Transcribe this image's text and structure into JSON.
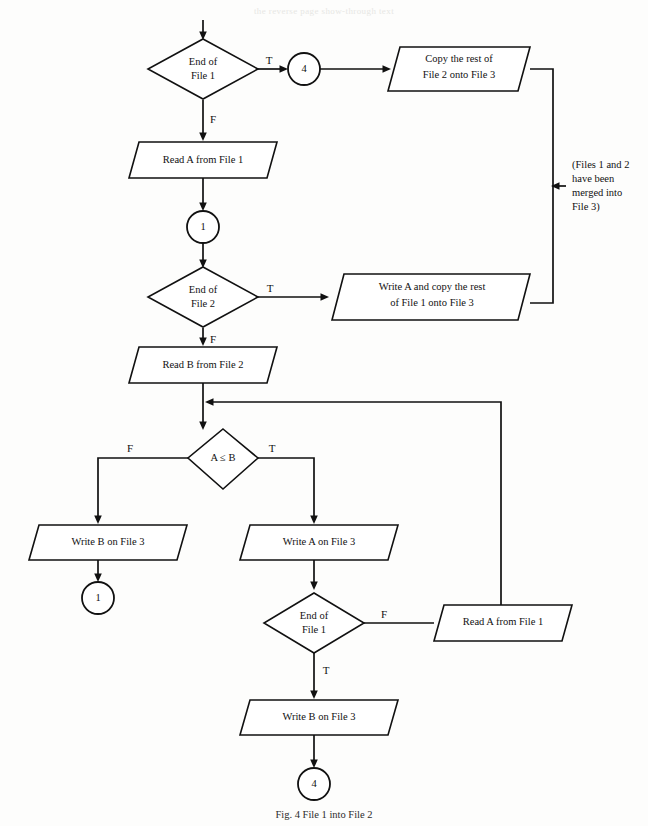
{
  "figure": {
    "caption": "Fig. 4  File 1 into File 2",
    "bleed_top": "the reverse page show-through text"
  },
  "nodes": {
    "d_end_file1_top": {
      "line1": "End of",
      "line2": "File 1"
    },
    "conn_4_top": {
      "label": "4"
    },
    "io_copy_rest_file2": {
      "line1": "Copy the rest of",
      "line2": "File 2 onto File 3"
    },
    "io_read_a_file1_top": {
      "line1": "Read A from File 1"
    },
    "conn_1_mid": {
      "label": "1"
    },
    "d_end_file2": {
      "line1": "End of",
      "line2": "File 2"
    },
    "io_write_a_copy_rest": {
      "line1": "Write A and copy the rest",
      "line2": "of File 1 onto File 3"
    },
    "io_read_b_file2": {
      "line1": "Read B from File 2"
    },
    "d_a_le_b": {
      "line1": "A ≤ B"
    },
    "io_write_b_file3_left": {
      "line1": "Write B on File 3"
    },
    "conn_1_bottom_left": {
      "label": "1"
    },
    "io_write_a_file3": {
      "line1": "Write A on File 3"
    },
    "d_end_file1_bottom": {
      "line1": "End of",
      "line2": "File 1"
    },
    "io_read_a_file1_bottom": {
      "line1": "Read A from File 1"
    },
    "io_write_b_file3_bottom": {
      "line1": "Write B on File 3"
    },
    "conn_4_bottom": {
      "label": "4"
    }
  },
  "branch_labels": {
    "end_file1_top_true": "T",
    "end_file1_top_false": "F",
    "end_file2_true": "T",
    "end_file2_false": "F",
    "a_le_b_false": "F",
    "a_le_b_true": "T",
    "end_file1_bottom_false": "F",
    "end_file1_bottom_true": "T"
  },
  "annotation": {
    "line1": "(Files 1 and 2",
    "line2": "have been",
    "line3": "merged into",
    "line4": "File 3)"
  },
  "colors": {
    "ink": "#111111",
    "paper": "#fdfdfc"
  }
}
